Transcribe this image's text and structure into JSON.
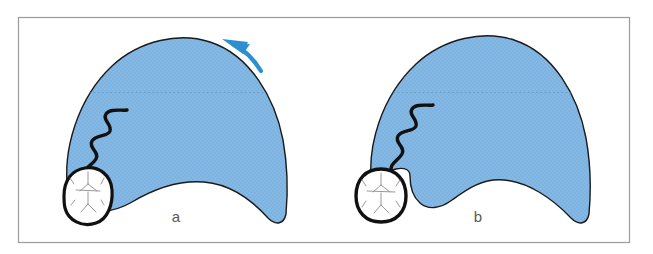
{
  "figure": {
    "type": "medical-illustration",
    "frame": {
      "border_color": "#9a9a9a",
      "background_color": "#ffffff",
      "x": 18,
      "y": 17,
      "width": 612,
      "height": 226
    },
    "colors": {
      "uterus_fill": "#7cb3e0",
      "uterus_outline": "#1a1a1a",
      "arrow": "#2b8fd0",
      "cord": "#111111",
      "skull_outline": "#111111",
      "skull_fill": "#ffffff",
      "suture_line": "#8d8d8d",
      "label_text": "#58585a",
      "dotted_line": "#5a93bd"
    },
    "panels": [
      {
        "id": "panel-a",
        "label": "a",
        "label_x": 176,
        "label_y": 222,
        "description": "uterus with fetal head engaged at lower left, curved arrow at upper right indicating rotation",
        "has_arrow": true,
        "head_attached": true
      },
      {
        "id": "panel-b",
        "label": "b",
        "label_x": 478,
        "label_y": 222,
        "description": "uterus with fetal head detached outside lower left margin, notch in uterine wall",
        "has_arrow": false,
        "head_attached": false
      }
    ],
    "elements": {
      "uterus_a": "uterus-shape-a",
      "uterus_b": "uterus-shape-b",
      "head_a": "fetal-head-a",
      "head_b": "fetal-head-b",
      "cord_a": "umbilical-cord-a",
      "cord_b": "umbilical-cord-b",
      "arrow": "rotation-arrow",
      "dotted_a": "dotted-reference-line-a",
      "dotted_b": "dotted-reference-line-b"
    }
  }
}
